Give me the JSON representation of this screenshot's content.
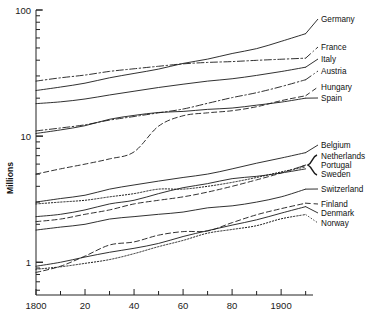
{
  "chart_data": {
    "type": "line",
    "title": "",
    "xlabel": "",
    "ylabel": "Millions",
    "yscale": "log",
    "ylim": [
      0.55,
      100
    ],
    "xlim": [
      1800,
      1913
    ],
    "grid": false,
    "legend_position": "right-inline",
    "y_ticks": [
      {
        "value": 100,
        "label": "100"
      },
      {
        "value": 10,
        "label": "10"
      },
      {
        "value": 1,
        "label": "1"
      }
    ],
    "x_ticks": [
      {
        "value": 1800,
        "label": "1800"
      },
      {
        "value": 1810,
        "label": ""
      },
      {
        "value": 1820,
        "label": "20"
      },
      {
        "value": 1830,
        "label": ""
      },
      {
        "value": 1840,
        "label": "40"
      },
      {
        "value": 1850,
        "label": ""
      },
      {
        "value": 1860,
        "label": "60"
      },
      {
        "value": 1870,
        "label": ""
      },
      {
        "value": 1880,
        "label": "80"
      },
      {
        "value": 1890,
        "label": ""
      },
      {
        "value": 1900,
        "label": "1900"
      },
      {
        "value": 1910,
        "label": ""
      }
    ],
    "x": [
      1800,
      1810,
      1820,
      1830,
      1840,
      1850,
      1860,
      1870,
      1880,
      1890,
      1900,
      1910
    ],
    "series": [
      {
        "name": "Germany",
        "style": "solid",
        "label": "Germany",
        "values": [
          23.0,
          24.5,
          26.3,
          29.0,
          31.4,
          34.0,
          37.7,
          40.8,
          45.2,
          49.4,
          56.4,
          64.9
        ]
      },
      {
        "name": "France",
        "style": "dashdot",
        "label": "France",
        "values": [
          27.3,
          29.0,
          30.5,
          32.6,
          34.2,
          35.8,
          37.4,
          38.4,
          39.0,
          39.9,
          40.7,
          41.5
        ]
      },
      {
        "name": "Italy",
        "style": "solid",
        "label": "Italy",
        "values": [
          18.1,
          18.7,
          19.7,
          21.2,
          22.7,
          24.3,
          25.8,
          27.3,
          28.5,
          30.3,
          32.5,
          35.2
        ]
      },
      {
        "name": "Austria",
        "style": "dashdot",
        "label": "Austria",
        "values": [
          11.0,
          11.6,
          12.3,
          13.4,
          14.3,
          15.3,
          16.4,
          18.2,
          20.2,
          22.1,
          24.7,
          28.0
        ]
      },
      {
        "name": "Hungary",
        "style": "dashed",
        "label": "Hungary",
        "values": [
          5.0,
          5.5,
          6.0,
          6.6,
          7.5,
          12.0,
          14.5,
          15.3,
          15.9,
          17.1,
          19.1,
          20.9
        ]
      },
      {
        "name": "Spain",
        "style": "solid",
        "label": "Spain",
        "values": [
          10.5,
          11.2,
          12.1,
          13.6,
          14.6,
          15.4,
          15.7,
          16.3,
          16.7,
          17.6,
          18.6,
          20.0
        ]
      },
      {
        "name": "Belgium",
        "style": "solid",
        "label": "Belgium",
        "values": [
          3.0,
          3.2,
          3.4,
          3.8,
          4.1,
          4.4,
          4.7,
          5.0,
          5.5,
          6.1,
          6.7,
          7.4
        ]
      },
      {
        "name": "Netherlands",
        "style": "dashed",
        "label": "Netherlands",
        "values": [
          2.1,
          2.2,
          2.4,
          2.6,
          2.9,
          3.1,
          3.3,
          3.6,
          4.0,
          4.5,
          5.1,
          5.9
        ]
      },
      {
        "name": "Portugal",
        "style": "dotted",
        "label": "Portugal",
        "values": [
          2.9,
          3.0,
          3.1,
          3.3,
          3.5,
          3.8,
          3.8,
          4.0,
          4.3,
          4.7,
          5.2,
          5.7
        ]
      },
      {
        "name": "Sweden",
        "style": "solid",
        "label": "Sweden",
        "values": [
          2.3,
          2.4,
          2.6,
          2.9,
          3.1,
          3.5,
          3.9,
          4.2,
          4.6,
          4.8,
          5.1,
          5.5
        ]
      },
      {
        "name": "Switzerland",
        "style": "solid",
        "label": "Switzerland",
        "values": [
          1.8,
          1.9,
          2.0,
          2.2,
          2.3,
          2.4,
          2.5,
          2.7,
          2.8,
          3.0,
          3.3,
          3.8
        ]
      },
      {
        "name": "Finland",
        "style": "dashed",
        "label": "Finland",
        "values": [
          0.83,
          0.93,
          1.12,
          1.37,
          1.45,
          1.64,
          1.75,
          1.77,
          2.06,
          2.38,
          2.66,
          2.94
        ]
      },
      {
        "name": "Denmark",
        "style": "solid",
        "label": "Denmark",
        "values": [
          0.93,
          1.0,
          1.1,
          1.2,
          1.29,
          1.41,
          1.6,
          1.78,
          1.97,
          2.17,
          2.45,
          2.76
        ]
      },
      {
        "name": "Norway",
        "style": "dotted",
        "label": "Norway",
        "values": [
          0.88,
          0.92,
          0.98,
          1.05,
          1.17,
          1.33,
          1.49,
          1.7,
          1.82,
          1.95,
          2.21,
          2.39
        ]
      }
    ],
    "label_groups": [
      {
        "label": "Germany",
        "bracket": false
      },
      {
        "label": "France",
        "bracket": false
      },
      {
        "label": "Italy",
        "bracket": false
      },
      {
        "label": "Austria",
        "bracket": false
      },
      {
        "label": "Hungary",
        "bracket": false
      },
      {
        "label": "Spain",
        "bracket": false
      },
      {
        "label": "Belgium",
        "bracket": false
      },
      {
        "label": "Netherlands",
        "bracket": true
      },
      {
        "label": "Portugal",
        "bracket": true
      },
      {
        "label": "Sweden",
        "bracket": true
      },
      {
        "label": "Switzerland",
        "bracket": false
      },
      {
        "label": "Finland",
        "bracket": false
      },
      {
        "label": "Denmark",
        "bracket": false
      },
      {
        "label": "Norway",
        "bracket": false
      }
    ]
  }
}
